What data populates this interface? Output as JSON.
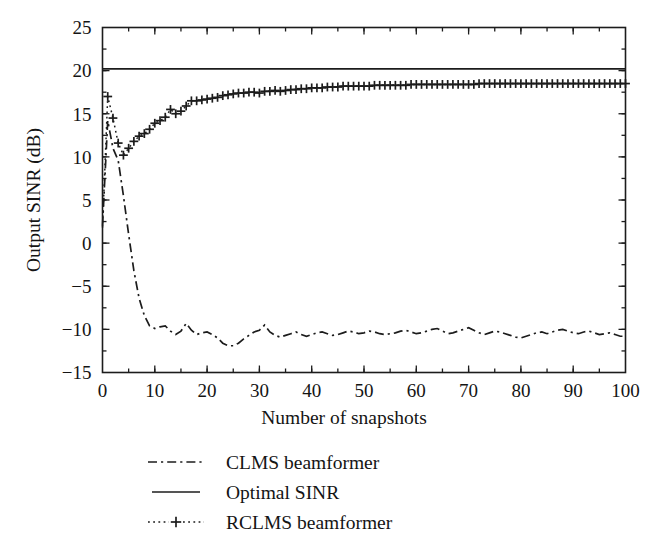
{
  "figure": {
    "background_color": "#ffffff",
    "ink_color": "#1c1c1c"
  },
  "chart_data": {
    "type": "line",
    "title": "",
    "subtitle": "",
    "xlabel": "Number of snapshots",
    "ylabel": "Output SINR (dB)",
    "xlim": [
      0,
      100
    ],
    "ylim": [
      -15,
      25
    ],
    "xticks": [
      0,
      10,
      20,
      30,
      40,
      50,
      60,
      70,
      80,
      90,
      100
    ],
    "xtick_labels": [
      "0",
      "10",
      "20",
      "30",
      "40",
      "50",
      "60",
      "70",
      "80",
      "90",
      "100"
    ],
    "x_minor_tick_step": 5,
    "yticks": [
      -15,
      -10,
      -5,
      0,
      5,
      10,
      15,
      20,
      25
    ],
    "ytick_labels": [
      "−15",
      "−10",
      "−5",
      "0",
      "5",
      "10",
      "15",
      "20",
      "25"
    ],
    "y_minor_tick_step": 2.5,
    "grid": false,
    "tick_direction": "in",
    "box": true,
    "legend_position": "below-axes-left",
    "annotations": [],
    "series": [
      {
        "name": "CLMS beamformer",
        "style": "dash-dot",
        "marker": "none",
        "legend_swatch": "dash-dot-line",
        "x": [
          0,
          1,
          2,
          3,
          4,
          5,
          6,
          7,
          8,
          9,
          10,
          11,
          12,
          13,
          14,
          15,
          16,
          17,
          18,
          19,
          20,
          21,
          22,
          23,
          24,
          25,
          26,
          27,
          28,
          29,
          30,
          31,
          32,
          33,
          34,
          35,
          36,
          37,
          38,
          39,
          40,
          41,
          42,
          43,
          44,
          45,
          46,
          47,
          48,
          49,
          50,
          51,
          52,
          53,
          54,
          55,
          56,
          57,
          58,
          59,
          60,
          61,
          62,
          63,
          64,
          65,
          66,
          67,
          68,
          69,
          70,
          71,
          72,
          73,
          74,
          75,
          76,
          77,
          78,
          79,
          80,
          81,
          82,
          83,
          84,
          85,
          86,
          87,
          88,
          89,
          90,
          91,
          92,
          93,
          94,
          95,
          96,
          97,
          98,
          99,
          100
        ],
        "y": [
          2.0,
          14.2,
          11.0,
          9.6,
          5.5,
          1.0,
          -3.2,
          -6.4,
          -8.4,
          -9.6,
          -9.9,
          -9.7,
          -9.6,
          -10.2,
          -10.6,
          -10.2,
          -9.3,
          -10.1,
          -10.6,
          -10.4,
          -10.3,
          -10.6,
          -11.0,
          -11.6,
          -11.9,
          -11.9,
          -11.6,
          -11.1,
          -10.7,
          -10.3,
          -10.1,
          -9.5,
          -10.3,
          -10.7,
          -10.9,
          -10.7,
          -10.5,
          -10.3,
          -10.6,
          -10.8,
          -10.6,
          -10.4,
          -10.3,
          -10.5,
          -10.7,
          -10.6,
          -10.4,
          -10.2,
          -10.3,
          -10.5,
          -10.4,
          -10.2,
          -10.3,
          -10.5,
          -10.6,
          -10.5,
          -10.4,
          -10.2,
          -10.1,
          -10.3,
          -10.5,
          -10.4,
          -10.2,
          -10.0,
          -9.9,
          -10.2,
          -10.5,
          -10.4,
          -10.2,
          -10.0,
          -9.8,
          -10.1,
          -10.4,
          -10.6,
          -10.4,
          -10.2,
          -10.3,
          -10.5,
          -10.7,
          -10.9,
          -11.0,
          -10.8,
          -10.6,
          -10.4,
          -10.3,
          -10.5,
          -10.3,
          -10.1,
          -10.0,
          -10.2,
          -10.4,
          -10.5,
          -10.3,
          -10.2,
          -10.4,
          -10.6,
          -10.5,
          -10.4,
          -10.6,
          -10.8,
          -10.8
        ]
      },
      {
        "name": "Optimal SINR",
        "style": "solid",
        "marker": "none",
        "legend_swatch": "solid-line",
        "x": [
          0,
          100
        ],
        "y": [
          20.2,
          20.2
        ]
      },
      {
        "name": "RCLMS beamformer",
        "style": "dotted",
        "marker": "plus",
        "legend_swatch": "dotted-plus-line",
        "x": [
          0,
          1,
          2,
          3,
          4,
          5,
          6,
          7,
          8,
          9,
          10,
          11,
          12,
          13,
          14,
          15,
          16,
          17,
          18,
          19,
          20,
          21,
          22,
          23,
          24,
          25,
          26,
          27,
          28,
          29,
          30,
          31,
          32,
          33,
          34,
          35,
          36,
          37,
          38,
          39,
          40,
          41,
          42,
          43,
          44,
          45,
          46,
          47,
          48,
          49,
          50,
          51,
          52,
          53,
          54,
          55,
          56,
          57,
          58,
          59,
          60,
          61,
          62,
          63,
          64,
          65,
          66,
          67,
          68,
          69,
          70,
          71,
          72,
          73,
          74,
          75,
          76,
          77,
          78,
          79,
          80,
          81,
          82,
          83,
          84,
          85,
          86,
          87,
          88,
          89,
          90,
          91,
          92,
          93,
          94,
          95,
          96,
          97,
          98,
          99,
          100
        ],
        "y": [
          1.8,
          17.0,
          14.5,
          11.6,
          10.2,
          11.0,
          11.8,
          12.4,
          12.7,
          13.2,
          13.9,
          14.2,
          14.6,
          15.5,
          15.0,
          15.3,
          15.9,
          16.5,
          16.5,
          16.6,
          16.7,
          16.8,
          16.9,
          17.1,
          17.2,
          17.3,
          17.4,
          17.4,
          17.5,
          17.5,
          17.4,
          17.6,
          17.6,
          17.7,
          17.6,
          17.7,
          17.8,
          17.8,
          17.9,
          17.9,
          18.0,
          18.0,
          18.0,
          18.1,
          18.1,
          18.1,
          18.2,
          18.2,
          18.2,
          18.2,
          18.2,
          18.2,
          18.3,
          18.3,
          18.3,
          18.3,
          18.3,
          18.3,
          18.3,
          18.4,
          18.4,
          18.4,
          18.4,
          18.4,
          18.4,
          18.4,
          18.4,
          18.4,
          18.4,
          18.4,
          18.4,
          18.4,
          18.5,
          18.5,
          18.5,
          18.5,
          18.5,
          18.5,
          18.5,
          18.5,
          18.5,
          18.5,
          18.5,
          18.5,
          18.5,
          18.5,
          18.5,
          18.5,
          18.5,
          18.5,
          18.5,
          18.5,
          18.5,
          18.5,
          18.5,
          18.5,
          18.5,
          18.5,
          18.5,
          18.5,
          18.5
        ]
      }
    ]
  },
  "legend": {
    "items": [
      {
        "label": "CLMS beamformer",
        "swatch": "dash-dot-line"
      },
      {
        "label": "Optimal SINR",
        "swatch": "solid-line"
      },
      {
        "label": "RCLMS beamformer",
        "swatch": "dotted-plus-line"
      }
    ]
  }
}
